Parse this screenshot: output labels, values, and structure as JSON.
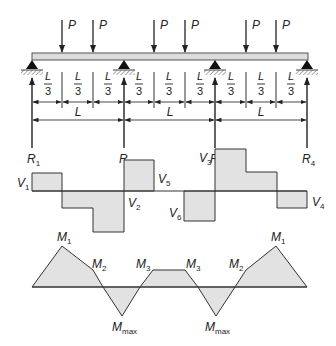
{
  "beam": {
    "loads": [
      {
        "label": "P",
        "x": 62
      },
      {
        "label": "P",
        "x": 93
      },
      {
        "label": "P",
        "x": 154
      },
      {
        "label": "P",
        "x": 185
      },
      {
        "label": "P",
        "x": 246
      },
      {
        "label": "P",
        "x": 276
      }
    ],
    "supports_x": [
      32,
      124,
      215,
      307
    ],
    "segment_label_num": "L",
    "segment_label_den": "3",
    "span_label": "L",
    "reactions": [
      {
        "label": "R",
        "sub": "1"
      },
      {
        "label": "R",
        "sub": "2"
      },
      {
        "label": "R",
        "sub": "3"
      },
      {
        "label": "R",
        "sub": "4"
      }
    ]
  },
  "shear_diagram": {
    "labels": [
      {
        "label": "V",
        "sub": "1"
      },
      {
        "label": "V",
        "sub": "2"
      },
      {
        "label": "V",
        "sub": "3"
      },
      {
        "label": "V",
        "sub": "4"
      },
      {
        "label": "V",
        "sub": "5"
      },
      {
        "label": "V",
        "sub": "6"
      }
    ]
  },
  "moment_diagram": {
    "labels": [
      {
        "label": "M",
        "sub": "1"
      },
      {
        "label": "M",
        "sub": "2"
      },
      {
        "label": "M",
        "sub": "max"
      },
      {
        "label": "M",
        "sub": "3"
      },
      {
        "label": "M",
        "sub": "3"
      },
      {
        "label": "M",
        "sub": "max"
      },
      {
        "label": "M",
        "sub": "2"
      },
      {
        "label": "M",
        "sub": "1"
      }
    ]
  },
  "colors": {
    "line": "#333333",
    "fill": "#e2e2e2",
    "beam_fill": "#dcdcdc"
  }
}
